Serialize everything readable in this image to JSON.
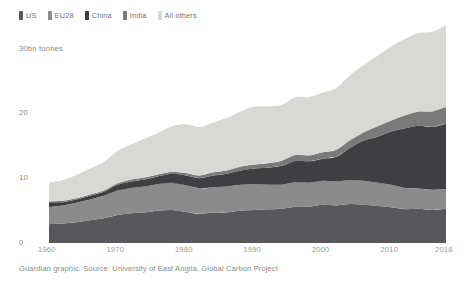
{
  "chart_data": {
    "type": "area",
    "stacked": true,
    "title": "",
    "subtitle": "",
    "xlabel": "",
    "ylabel": "30bn tonnes",
    "xlim": [
      1960,
      2018
    ],
    "ylim": [
      0,
      37
    ],
    "grid": false,
    "legend_position": "top-left",
    "y_ticks": [
      "30bn tonnes",
      "20",
      "10",
      "0"
    ],
    "y_tick_values": [
      30,
      20,
      10,
      0
    ],
    "x_ticks": [
      "1960",
      "1970",
      "1980",
      "1990",
      "2000",
      "2010",
      "2018"
    ],
    "x_tick_values": [
      1960,
      1970,
      1980,
      1990,
      2000,
      2010,
      2018
    ],
    "x": [
      1960,
      1962,
      1964,
      1966,
      1968,
      1970,
      1972,
      1974,
      1976,
      1978,
      1980,
      1982,
      1984,
      1986,
      1988,
      1990,
      1992,
      1994,
      1996,
      1998,
      2000,
      2002,
      2004,
      2006,
      2008,
      2010,
      2012,
      2014,
      2016,
      2018
    ],
    "series": [
      {
        "name": "US",
        "color": "#58585a",
        "values": [
          2.9,
          3.0,
          3.2,
          3.5,
          3.8,
          4.3,
          4.6,
          4.7,
          5.0,
          5.1,
          4.8,
          4.5,
          4.7,
          4.7,
          5.0,
          5.1,
          5.2,
          5.3,
          5.6,
          5.6,
          5.9,
          5.8,
          6.0,
          5.9,
          5.7,
          5.5,
          5.2,
          5.3,
          5.1,
          5.3
        ]
      },
      {
        "name": "EU28",
        "color": "#8b8b8b",
        "values": [
          2.6,
          2.8,
          3.0,
          3.2,
          3.5,
          3.8,
          3.9,
          4.0,
          4.1,
          4.2,
          4.1,
          3.9,
          3.9,
          4.0,
          4.0,
          4.0,
          3.8,
          3.7,
          3.8,
          3.7,
          3.7,
          3.7,
          3.7,
          3.7,
          3.6,
          3.5,
          3.3,
          3.1,
          3.1,
          3.0
        ]
      },
      {
        "name": "China",
        "color": "#3f3f41",
        "values": [
          0.8,
          0.5,
          0.5,
          0.6,
          0.6,
          0.9,
          1.0,
          1.1,
          1.2,
          1.4,
          1.5,
          1.6,
          1.8,
          2.0,
          2.2,
          2.4,
          2.6,
          2.9,
          3.3,
          3.3,
          3.4,
          3.8,
          5.0,
          6.2,
          7.1,
          8.2,
          9.2,
          9.7,
          9.7,
          10.1
        ]
      },
      {
        "name": "India",
        "color": "#7a7a7a",
        "values": [
          0.1,
          0.2,
          0.2,
          0.2,
          0.2,
          0.2,
          0.3,
          0.3,
          0.3,
          0.3,
          0.4,
          0.4,
          0.5,
          0.5,
          0.6,
          0.6,
          0.7,
          0.8,
          0.9,
          0.9,
          1.0,
          1.1,
          1.2,
          1.3,
          1.6,
          1.7,
          2.0,
          2.2,
          2.4,
          2.6
        ]
      },
      {
        "name": "All others",
        "color": "#d8d8d4",
        "values": [
          2.9,
          3.2,
          3.6,
          4.0,
          4.4,
          5.0,
          5.4,
          6.0,
          6.4,
          7.0,
          7.5,
          7.5,
          7.7,
          8.1,
          8.5,
          8.9,
          8.8,
          8.6,
          8.9,
          9.0,
          9.2,
          9.5,
          10.0,
          10.4,
          10.9,
          11.4,
          11.8,
          12.1,
          12.3,
          12.6
        ]
      }
    ]
  },
  "legend": {
    "items": [
      {
        "label": "US",
        "color": "#58585a"
      },
      {
        "label": "EU28",
        "color": "#8b8b8b"
      },
      {
        "label": "China",
        "color": "#3f3f41"
      },
      {
        "label": "India",
        "color": "#7a7a7a"
      },
      {
        "label": "All others",
        "color": "#d8d8d4"
      }
    ]
  },
  "caption": {
    "text": "Guardian graphic. Source: University of East Anglia, Global Carbon Project"
  }
}
